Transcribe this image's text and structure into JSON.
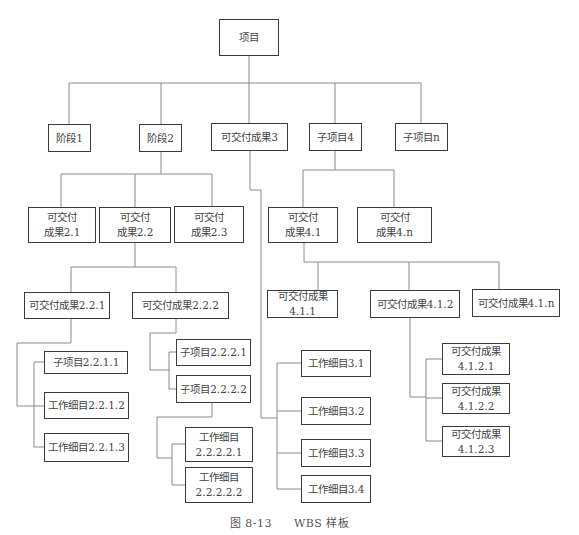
{
  "diagram": {
    "type": "WBS tree",
    "caption": {
      "figure_no": "图 8-13",
      "title": "WBS 样板"
    },
    "nodes": {
      "root": "项目",
      "l1": [
        "阶段1",
        "阶段2",
        "可交付成果3",
        "子项目4",
        "子项目n"
      ],
      "stage2_children": [
        "可交付\n成果2.1",
        "可交付\n成果2.2",
        "可交付\n成果2.3"
      ],
      "d22_children": [
        "可交付成果2.2.1",
        "可交付成果2.2.2"
      ],
      "d221_children": [
        "子项目2.2.1.1",
        "工作细目2.2.1.2",
        "工作细目2.2.1.3"
      ],
      "d222_children": [
        "子项目2.2.2.1",
        "子项目2.2.2.2"
      ],
      "d2222_children": [
        "工作细目\n2.2.2.2.1",
        "工作细目\n2.2.2.2.2"
      ],
      "d3_children": [
        "工作细目3.1",
        "工作细目3.2",
        "工作细目3.3",
        "工作细目3.4"
      ],
      "sub4_children": [
        "可交付\n成果4.1",
        "可交付\n成果4.n"
      ],
      "d41_children": [
        "可交付成果4.1.1",
        "可交付成果4.1.2",
        "可交付成果4.1.n"
      ],
      "d412_children": [
        "可交付成果\n4.1.2.1",
        "可交付成果\n4.1.2.2",
        "可交付成果\n4.1.2.3"
      ]
    }
  }
}
